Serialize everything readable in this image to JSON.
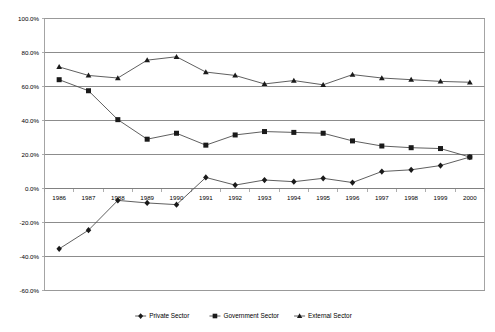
{
  "chart_data": {
    "type": "line",
    "title": "",
    "subtitle": "",
    "xlabel": "",
    "ylabel": "",
    "categories": [
      "1986",
      "1987",
      "1988",
      "1989",
      "1990",
      "1991",
      "1992",
      "1993",
      "1994",
      "1995",
      "1996",
      "1997",
      "1998",
      "1999",
      "2000"
    ],
    "ylim": [
      -60,
      100
    ],
    "ytick_values": [
      100,
      80,
      60,
      40,
      20,
      0,
      -20,
      -40,
      -60
    ],
    "ytick_labels": [
      "100.0%",
      "80.0%",
      "60.0%",
      "40.0%",
      "20.0%",
      "0.0%",
      "-20.0%",
      "-40.0%",
      "-60.0%"
    ],
    "grid": true,
    "grid_axis": "y",
    "legend_position": "bottom",
    "value_suffix": "%",
    "series": [
      {
        "name": "Private Sector",
        "marker": "diamond",
        "color": "#1a1a1a",
        "values": [
          -35.5,
          -24.5,
          -7.0,
          -8.5,
          -9.5,
          6.5,
          2.0,
          5.0,
          4.0,
          6.0,
          3.5,
          10.0,
          11.0,
          13.5,
          18.5
        ]
      },
      {
        "name": "Government Sector",
        "marker": "square",
        "color": "#1a1a1a",
        "values": [
          64.0,
          57.5,
          40.5,
          29.0,
          32.5,
          25.5,
          31.5,
          33.5,
          33.0,
          32.5,
          28.0,
          25.0,
          24.0,
          23.5,
          18.5
        ]
      },
      {
        "name": "External Sector",
        "marker": "triangle",
        "color": "#1a1a1a",
        "values": [
          71.5,
          66.5,
          65.0,
          75.5,
          77.5,
          68.5,
          66.5,
          61.5,
          63.5,
          61.0,
          67.0,
          65.0,
          64.0,
          63.0,
          62.5
        ]
      }
    ]
  },
  "legend": {
    "items": [
      {
        "label": "Private Sector",
        "marker": "diamond"
      },
      {
        "label": "Government Sector",
        "marker": "square"
      },
      {
        "label": "External Sector",
        "marker": "triangle"
      }
    ]
  },
  "colors": {
    "gridline": "#808080",
    "border": "#9a9a9a",
    "series_line": "#4d4d4d",
    "marker": "#1a1a1a",
    "background": "#ffffff",
    "text": "#000000"
  }
}
